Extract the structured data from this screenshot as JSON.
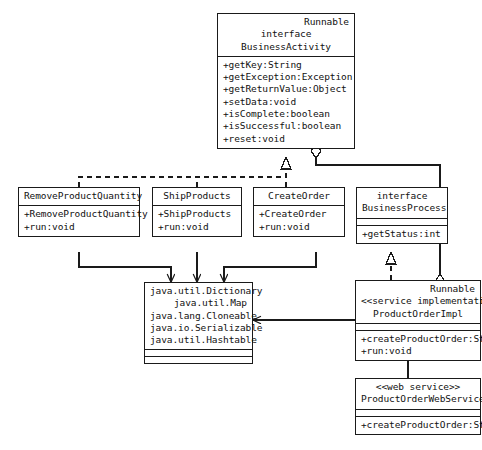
{
  "diagram": {
    "stroke_color": "#1a1a1a",
    "text_color": "#111111",
    "background": "#ffffff"
  },
  "classes": {
    "business_activity": {
      "stereotype_right": "Runnable",
      "keyword": "interface",
      "name": "BusinessActivity",
      "operations": [
        "+getKey:String",
        "+getException:Exception",
        "+getReturnValue:Object",
        "+setData:void",
        "+isComplete:boolean",
        "+isSuccessful:boolean",
        "+reset:void"
      ]
    },
    "remove_product_quantity": {
      "name": "RemoveProductQuantity",
      "operations": [
        "+RemoveProductQuantity",
        "+run:void"
      ]
    },
    "ship_products": {
      "name": "ShipProducts",
      "operations": [
        "+ShipProducts",
        "+run:void"
      ]
    },
    "create_order": {
      "name": "CreateOrder",
      "operations": [
        "+CreateOrder",
        "+run:void"
      ]
    },
    "business_process": {
      "keyword": "interface",
      "name": "BusinessProcess",
      "operations": [
        "+getStatus:int"
      ]
    },
    "java_types": {
      "names": [
        "java.util.Dictionary",
        "java.util.Map",
        "java.lang.Cloneable",
        "java.io.Serializable",
        "java.util.Hashtable"
      ]
    },
    "product_order_impl": {
      "stereotype_right": "Runnable",
      "stereotype": "<<service implementation>>",
      "name": "ProductOrderImpl",
      "operations": [
        "+createProductOrder:String",
        "+run:void"
      ]
    },
    "product_order_web_service": {
      "stereotype": "<<web service>>",
      "name": "ProductOrderWebService",
      "operations": [
        "+createProductOrder:String"
      ]
    }
  },
  "relationships": [
    {
      "name": "realization-tasks-to-businessactivity",
      "type": "realization",
      "style": "dashed",
      "arrowhead": "hollow-triangle",
      "from": [
        "RemoveProductQuantity",
        "ShipProducts",
        "CreateOrder"
      ],
      "to": "BusinessActivity"
    },
    {
      "name": "dependency-tasks-to-javatypes",
      "type": "dependency",
      "style": "solid",
      "arrowhead": "open-arrow",
      "from": [
        "RemoveProductQuantity",
        "ShipProducts",
        "CreateOrder"
      ],
      "to": "java.util.Dictionary"
    },
    {
      "name": "realization-productorderimpl-to-businessprocess",
      "type": "realization",
      "style": "dashed",
      "arrowhead": "hollow-triangle",
      "from": [
        "ProductOrderImpl"
      ],
      "to": "BusinessProcess"
    },
    {
      "name": "aggregation-productorderimpl-to-businessactivity",
      "type": "aggregation",
      "style": "solid",
      "arrowhead": "hollow-diamond",
      "from": [
        "ProductOrderImpl"
      ],
      "to": "BusinessActivity"
    },
    {
      "name": "dependency-productorderimpl-to-javatypes",
      "type": "dependency",
      "style": "solid",
      "arrowhead": "open-arrow",
      "from": [
        "ProductOrderImpl"
      ],
      "to": "java.io.Serializable"
    },
    {
      "name": "association-productorderimpl-to-webservice",
      "type": "association",
      "style": "solid",
      "arrowhead": "none",
      "from": [
        "ProductOrderImpl"
      ],
      "to": "ProductOrderWebService"
    }
  ]
}
